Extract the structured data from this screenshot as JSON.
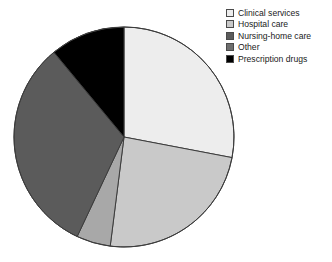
{
  "legend": {
    "position": "top-right",
    "items": [
      {
        "label": "Clinical services",
        "color": "#ededed",
        "swatch_name": "legend-swatch-clinical-services"
      },
      {
        "label": "Hospital care",
        "color": "#c9c9c9",
        "swatch_name": "legend-swatch-hospital-care"
      },
      {
        "label": "Nursing-home care",
        "color": "#5b5b5b",
        "swatch_name": "legend-swatch-nursing-home-care"
      },
      {
        "label": "Other",
        "color": "#6e6e6e",
        "swatch_name": "legend-swatch-other"
      },
      {
        "label": "Prescription drugs",
        "color": "#000000",
        "swatch_name": "legend-swatch-prescription-drugs"
      }
    ]
  },
  "caption": {
    "text": ""
  },
  "chart_data": {
    "type": "pie",
    "title": "",
    "subtitle": "",
    "xlabel": "",
    "ylabel": "",
    "grid": false,
    "legend_position": "top-right",
    "start_angle_deg": 0,
    "direction": "clockwise",
    "center": {
      "x": 124,
      "y": 137
    },
    "radius": 110,
    "labels": [
      "Clinical services",
      "Hospital care",
      "Other",
      "Nursing-home care",
      "Prescription drugs"
    ],
    "values": [
      28,
      24,
      5,
      32,
      11
    ],
    "units": "percent",
    "slices": [
      {
        "label": "Clinical services",
        "value": 28,
        "start_deg": 0,
        "end_deg": 100.8,
        "color": "#ededed",
        "edge": "#3c3c3c"
      },
      {
        "label": "Hospital care",
        "value": 24,
        "start_deg": 100.8,
        "end_deg": 187.2,
        "color": "#c9c9c9",
        "edge": "#3c3c3c"
      },
      {
        "label": "Other",
        "value": 5,
        "start_deg": 187.2,
        "end_deg": 205.2,
        "color": "#a8a8a8",
        "edge": "#3c3c3c"
      },
      {
        "label": "Nursing-home care",
        "value": 32,
        "start_deg": 205.2,
        "end_deg": 320.4,
        "color": "#5b5b5b",
        "edge": "#3c3c3c"
      },
      {
        "label": "Prescription drugs",
        "value": 11,
        "start_deg": 320.4,
        "end_deg": 360,
        "color": "#000000",
        "edge": "#3c3c3c"
      }
    ]
  }
}
